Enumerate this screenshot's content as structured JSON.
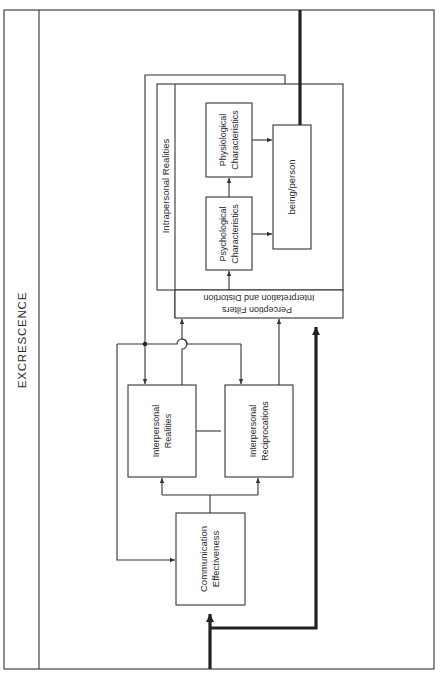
{
  "diagram": {
    "frame_label": "EXCRESCENCE",
    "nodes": {
      "communication_effectiveness": {
        "line1": "Communication",
        "line2": "Effectiveness"
      },
      "interpersonal_realities": {
        "line1": "Interpersonal",
        "line2": "Realities"
      },
      "interpersonal_reciprocations": {
        "line1": "Interpersonal",
        "line2": "Reciprocations"
      },
      "perception_filters": {
        "line1": "Perception Filters",
        "line2": "Interpretation and Distortion"
      },
      "intrapersonal_realities": {
        "label": "Intrapersonal Realities"
      },
      "psychological": {
        "line1": "Psychological",
        "line2": "Characteristics"
      },
      "physiological": {
        "line1": "Physiological",
        "line2": "Characteristics"
      },
      "being_person": {
        "label": "being/person"
      }
    },
    "edges": [
      {
        "from": "input",
        "to": "communication_effectiveness",
        "weight": "thick"
      },
      {
        "from": "input",
        "to": "perception_filters",
        "weight": "thick"
      },
      {
        "from": "communication_effectiveness",
        "to": "interpersonal_realities"
      },
      {
        "from": "communication_effectiveness",
        "to": "interpersonal_reciprocations"
      },
      {
        "from": "interpersonal_realities",
        "to": "interpersonal_reciprocations",
        "type": "line"
      },
      {
        "from": "interpersonal_realities",
        "to": "perception_filters"
      },
      {
        "from": "interpersonal_reciprocations",
        "to": "perception_filters"
      },
      {
        "from": "perception_filters",
        "to": "psychological"
      },
      {
        "from": "psychological",
        "to": "physiological"
      },
      {
        "from": "psychological",
        "to": "being_person"
      },
      {
        "from": "physiological",
        "to": "being_person"
      },
      {
        "from": "being_person",
        "to": "output",
        "weight": "thick"
      },
      {
        "from": "being_person",
        "to": "interpersonal_realities",
        "via": "feedback loop"
      },
      {
        "from": "being_person",
        "to": "interpersonal_reciprocations",
        "via": "feedback loop"
      },
      {
        "from": "being_person",
        "to": "communication_effectiveness",
        "via": "feedback loop"
      }
    ]
  }
}
